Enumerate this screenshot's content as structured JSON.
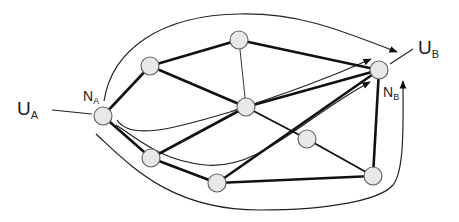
{
  "diagram": {
    "type": "network-flow",
    "labels": {
      "ua": {
        "main": "U",
        "sub": "A"
      },
      "ub": {
        "main": "U",
        "sub": "B"
      },
      "na": {
        "main": "N",
        "sub": "A"
      },
      "nb": {
        "main": "N",
        "sub": "B"
      }
    },
    "nodes": [
      {
        "id": "NA",
        "x": 103,
        "y": 116
      },
      {
        "id": "TL",
        "x": 150,
        "y": 66
      },
      {
        "id": "TOP",
        "x": 239,
        "y": 40
      },
      {
        "id": "CENTER",
        "x": 246,
        "y": 107
      },
      {
        "id": "NB",
        "x": 379,
        "y": 70
      },
      {
        "id": "LL",
        "x": 151,
        "y": 158
      },
      {
        "id": "BOTTOM",
        "x": 217,
        "y": 183
      },
      {
        "id": "RC",
        "x": 307,
        "y": 139
      },
      {
        "id": "BR",
        "x": 373,
        "y": 176
      }
    ],
    "edges": [
      {
        "from": "NA",
        "to": "TL",
        "weight": "thick"
      },
      {
        "from": "NA",
        "to": "LL",
        "weight": "thick"
      },
      {
        "from": "TL",
        "to": "TOP",
        "weight": "thick"
      },
      {
        "from": "TL",
        "to": "CENTER",
        "weight": "thick"
      },
      {
        "from": "TOP",
        "to": "NB",
        "weight": "thick"
      },
      {
        "from": "TOP",
        "to": "CENTER",
        "weight": "thin"
      },
      {
        "from": "CENTER",
        "to": "NB",
        "weight": "thick"
      },
      {
        "from": "CENTER",
        "to": "RC",
        "weight": "medium"
      },
      {
        "from": "LL",
        "to": "CENTER",
        "weight": "thick"
      },
      {
        "from": "LL",
        "to": "BOTTOM",
        "weight": "thick"
      },
      {
        "from": "BOTTOM",
        "to": "NB",
        "weight": "thick"
      },
      {
        "from": "BOTTOM",
        "to": "BR",
        "weight": "thick"
      },
      {
        "from": "RC",
        "to": "BR",
        "weight": "medium"
      },
      {
        "from": "BR",
        "to": "NB",
        "weight": "thick"
      }
    ],
    "colors": {
      "node_fill": "#e8e8e8",
      "node_stroke": "#666666",
      "edge": "#111111",
      "background": "#ffffff"
    }
  }
}
